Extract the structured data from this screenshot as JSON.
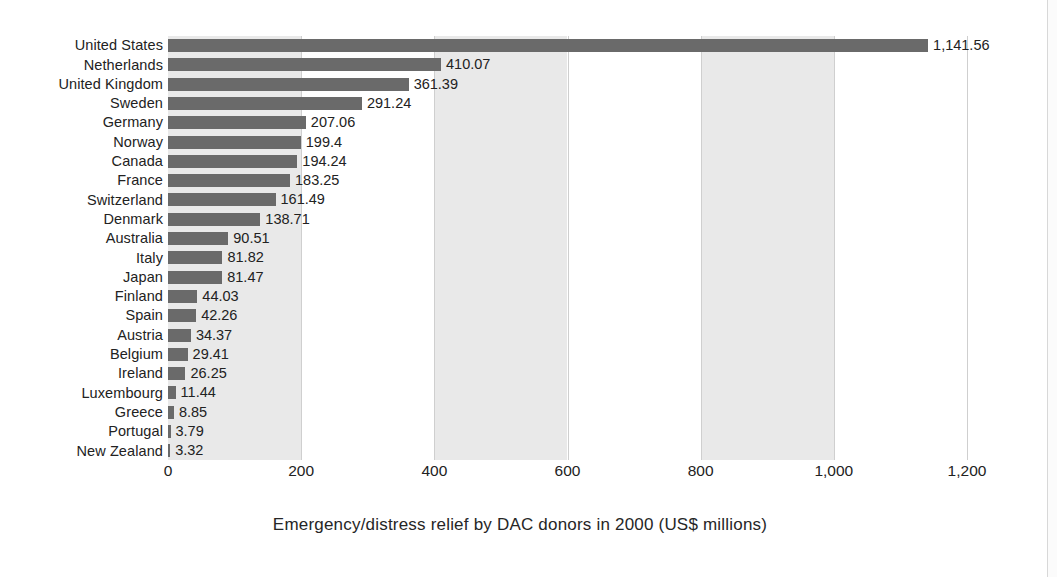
{
  "chart_data": {
    "type": "bar",
    "orientation": "horizontal",
    "title": "Emergency/distress relief by DAC donors in 2000 (US$ millions)",
    "xlabel": "",
    "ylabel": "",
    "xlim": [
      0,
      1200
    ],
    "xticks": [
      "0",
      "200",
      "400",
      "600",
      "800",
      "1,000",
      "1,200"
    ],
    "xtick_values": [
      0,
      200,
      400,
      600,
      800,
      1000,
      1200
    ],
    "grid": true,
    "legend": "none",
    "categories": [
      "United States",
      "Netherlands",
      "United Kingdom",
      "Sweden",
      "Germany",
      "Norway",
      "Canada",
      "France",
      "Switzerland",
      "Denmark",
      "Australia",
      "Italy",
      "Japan",
      "Finland",
      "Spain",
      "Austria",
      "Belgium",
      "Ireland",
      "Luxembourg",
      "Greece",
      "Portugal",
      "New Zealand"
    ],
    "values": [
      1141.56,
      410.07,
      361.39,
      291.24,
      207.06,
      199.4,
      194.24,
      183.25,
      161.49,
      138.71,
      90.51,
      81.82,
      81.47,
      44.03,
      42.26,
      34.37,
      29.41,
      26.25,
      11.44,
      8.85,
      3.79,
      3.32
    ],
    "value_labels": [
      "1,141.56",
      "410.07",
      "361.39",
      "291.24",
      "207.06",
      "199.4",
      "194.24",
      "183.25",
      "161.49",
      "138.71",
      "90.51",
      "81.82",
      "81.47",
      "44.03",
      "42.26",
      "34.37",
      "29.41",
      "26.25",
      "11.44",
      "8.85",
      "3.79",
      "3.32"
    ],
    "bands": [
      {
        "from": 0,
        "to": 200,
        "shaded": true
      },
      {
        "from": 200,
        "to": 400,
        "shaded": false
      },
      {
        "from": 400,
        "to": 600,
        "shaded": true
      },
      {
        "from": 600,
        "to": 800,
        "shaded": false
      },
      {
        "from": 800,
        "to": 1000,
        "shaded": true
      },
      {
        "from": 1000,
        "to": 1200,
        "shaded": false
      }
    ],
    "colors": {
      "bar": "#6a6a6a",
      "band": "#e9e9e9",
      "gridline": "#cfcfcf",
      "text": "#222222",
      "background": "#ffffff"
    }
  },
  "caption": {
    "text": "Emergency/distress relief by DAC donors in 2000 (US$ millions)"
  }
}
